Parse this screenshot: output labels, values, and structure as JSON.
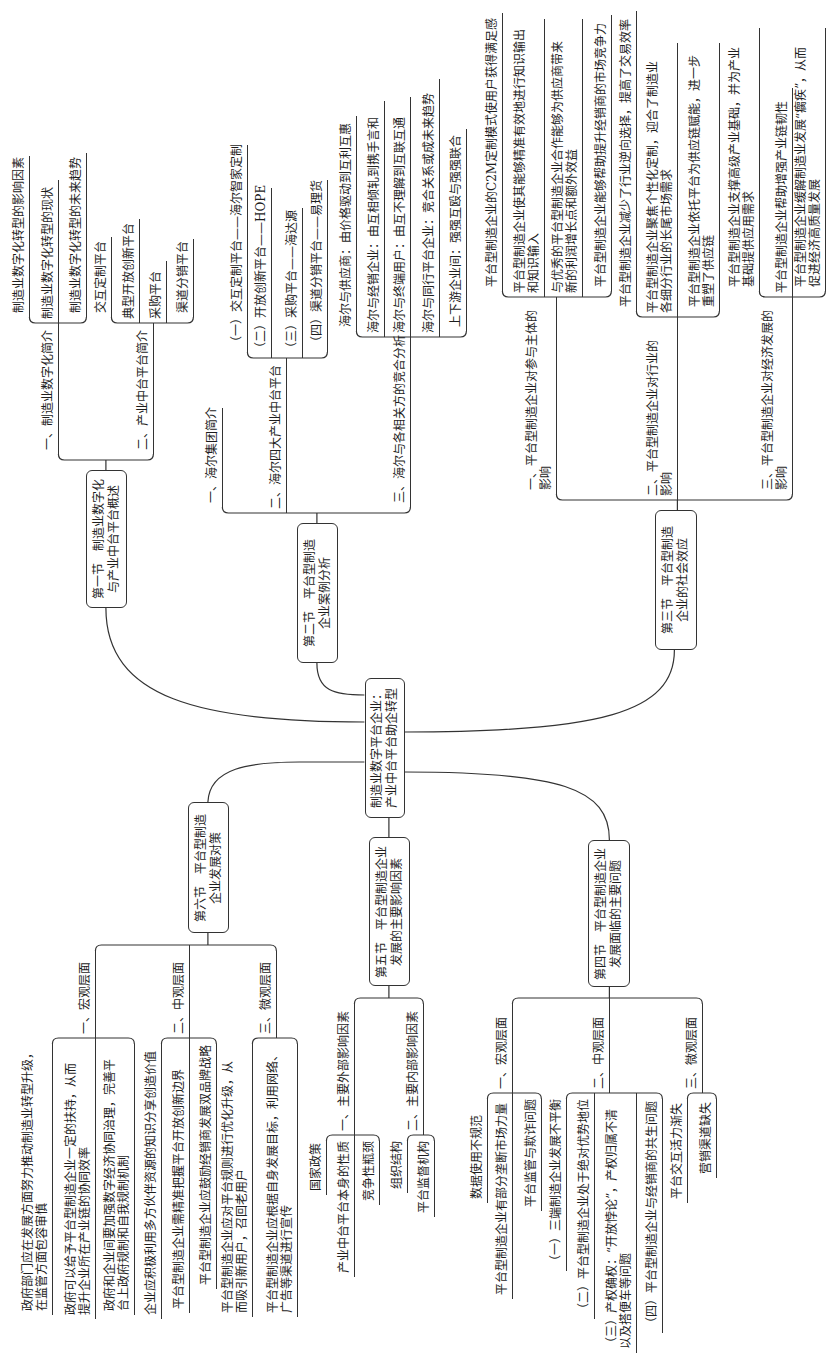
{
  "central": {
    "lines": [
      "制造业数字平台企业：",
      "产业中台平台助企转型"
    ]
  },
  "sections": [
    {
      "title": [
        "第一节　制造业数字化",
        "与产业中台平台概述"
      ],
      "topics": [
        {
          "lines": [
            "一、制造业数字化简介"
          ],
          "items": [
            {
              "lines": [
                "制造业数字化转型的影响因素"
              ]
            },
            {
              "lines": [
                "制造业数字化转型的现状"
              ]
            },
            {
              "lines": [
                "制造业数字化转型的未来趋势"
              ]
            }
          ]
        },
        {
          "lines": [
            "二、产业中台平台简介"
          ],
          "items": [
            {
              "lines": [
                "交互定制平台"
              ]
            },
            {
              "lines": [
                "典型开放创新平台"
              ]
            },
            {
              "lines": [
                "采购平台"
              ]
            },
            {
              "lines": [
                "渠道分销平台"
              ]
            }
          ]
        }
      ]
    },
    {
      "title": [
        "第二节　平台型制造",
        "企业案例分析"
      ],
      "topics": [
        {
          "lines": [
            "一、海尔集团简介"
          ],
          "items": []
        },
        {
          "lines": [
            "二、海尔四大产业中台平台"
          ],
          "items": [
            {
              "lines": [
                "（一）交互定制平台——海尔智家定制"
              ]
            },
            {
              "lines": [
                "（二）开放创新平台——HOPE"
              ]
            },
            {
              "lines": [
                "（三）采购平台——海达源"
              ]
            },
            {
              "lines": [
                "（四）渠道分销平台——易理货"
              ]
            }
          ]
        },
        {
          "lines": [
            "三、海尔与各相关方的竞合分析"
          ],
          "items": [
            {
              "lines": [
                "海尔与供应商：由价格驱动到互利互惠"
              ]
            },
            {
              "lines": [
                "海尔与经销企业：由互相倾轧到携手言和"
              ]
            },
            {
              "lines": [
                "海尔与终端用户：由互不理解到互联互通"
              ]
            },
            {
              "lines": [
                "海尔与同行平台企业：竞合关系或成未来趋势"
              ]
            },
            {
              "lines": [
                "上下游企业间：强强互殴与强强联合"
              ]
            }
          ]
        }
      ]
    },
    {
      "title": [
        "第三节　平台型制造",
        "企业的社会效应"
      ],
      "topics": [
        {
          "lines": [
            "一、平台型制造企业对参与主体的",
            "影响"
          ],
          "items": [
            {
              "lines": [
                "平台型制造企业的C2M定制模式使用户获得满足感"
              ]
            },
            {
              "lines": [
                "平台型制造企业使其能够精准有效地进行知识输出",
                "和知识输入"
              ]
            },
            {
              "lines": [
                "与优秀的平台型制造企业合作能够为供应商带来",
                "新的利润增长点和额外效益"
              ]
            },
            {
              "lines": [
                "平台型制造企业能够帮助提升经销商的市场竞争力"
              ]
            }
          ]
        },
        {
          "lines": [
            "二、平台型制造企业对行业的",
            "影响"
          ],
          "items": [
            {
              "lines": [
                "平台型制造企业减少了行业逆向选择，提高了交易效率"
              ]
            },
            {
              "lines": [
                "平台型制造企业聚焦个性化定制，迎合了制造业",
                "各细分行业的长尾市场需求"
              ]
            },
            {
              "lines": [
                "平台型制造企业依托平台为供应链赋能，进一步",
                "重塑了供应链"
              ]
            }
          ]
        },
        {
          "lines": [
            "三、平台型制造企业对经济发展的",
            "影响"
          ],
          "items": [
            {
              "lines": [
                "平台型制造企业支撑高级产业基础，并为产业",
                "基础提供应用需求"
              ]
            },
            {
              "lines": [
                "平台型制造企业帮助增强产业链韧性"
              ]
            },
            {
              "lines": [
                "平台型制造企业缓解制造业发展“瘸疾”，从而",
                "促进经济高质量发展"
              ]
            }
          ]
        }
      ]
    },
    {
      "title": [
        "第四节　平台型制造企业",
        "发展面临的主要问题"
      ],
      "topics": [
        {
          "lines": [
            "一、宏观层面"
          ],
          "items": [
            {
              "lines": [
                "数据使用不规范"
              ]
            },
            {
              "lines": [
                "平台型制造企业有部分垄断市场力量"
              ]
            },
            {
              "lines": [
                "平台监管与欺诈问题"
              ]
            }
          ]
        },
        {
          "lines": [
            "二、中观层面"
          ],
          "items": [
            {
              "lines": [
                "（一）三端制造企业发展不平衡"
              ]
            },
            {
              "lines": [
                "（二）平台型制造企业处于绝对优势地位"
              ]
            },
            {
              "lines": [
                "（三）产权确权：“开放悖论”，产权归属不清",
                "以及搭便车等问题"
              ]
            },
            {
              "lines": [
                "（四）平台型制造企业与经销商的共生问题"
              ]
            }
          ]
        },
        {
          "lines": [
            "三、微观层面"
          ],
          "items": [
            {
              "lines": [
                "平台交互活力渐失"
              ]
            },
            {
              "lines": [
                "营销渠道缺失"
              ]
            }
          ]
        }
      ]
    },
    {
      "title": [
        "第五节　平台型制造企业",
        "发展的主要影响因素"
      ],
      "topics": [
        {
          "lines": [
            "一、主要外部影响因素"
          ],
          "items": [
            {
              "lines": [
                "国家政策"
              ]
            },
            {
              "lines": [
                "产业中台平台本身的性质"
              ]
            },
            {
              "lines": [
                "竞争性瓶颈"
              ]
            }
          ]
        },
        {
          "lines": [
            "二、主要内部影响因素"
          ],
          "items": [
            {
              "lines": [
                "组织结构"
              ]
            },
            {
              "lines": [
                "平台监督机构"
              ]
            }
          ]
        }
      ]
    },
    {
      "title": [
        "第六节　平台型制造",
        "企业发展对策"
      ],
      "topics": [
        {
          "lines": [
            "一、宏观层面"
          ],
          "items": [
            {
              "lines": [
                "政府部门应在发展方面努力推动制造业转型升级，",
                "在监管方面包容审慎"
              ]
            },
            {
              "lines": [
                "政府可以给予平台型制造企业一定的扶持，从而",
                "提升企业所在产业链的协同效率"
              ]
            },
            {
              "lines": [
                "政府和企业间要加强数字经济协同治理，完善平",
                "台上政府规制和自我规制机制"
              ]
            }
          ]
        },
        {
          "lines": [
            "二、中观层面"
          ],
          "items": [
            {
              "lines": [
                "企业应积极利用多方伙伴资源的知识分享创造价值"
              ]
            },
            {
              "lines": [
                "平台型制造企业需精准把握平台开放创新边界"
              ]
            },
            {
              "lines": [
                "平台型制造企业应鼓励经销商发展双品牌战略"
              ]
            }
          ]
        },
        {
          "lines": [
            "三、微观层面"
          ],
          "items": [
            {
              "lines": [
                "平台型制造企业应对平台规则进行优化升级，从",
                "而吸引新用户，召回老用户"
              ]
            },
            {
              "lines": [
                "平台型制造企业应根据自身发展目标，利用网络、",
                "广告等渠道进行宣传"
              ]
            }
          ]
        }
      ]
    }
  ]
}
